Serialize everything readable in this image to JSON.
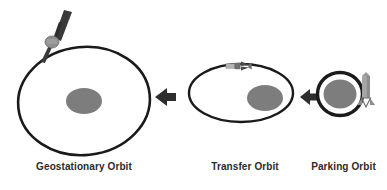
{
  "diagram": {
    "background_color": "#ffffff",
    "stroke_color": "#1a1a1a",
    "earth_color": "#7d7d7d",
    "satellite_body_color": "#8a8a8a",
    "satellite_panel_color": "#3a3a3a",
    "rocket_color": "#9a9a9a",
    "arrow_color": "#2e2e2e",
    "label_color": "#2b2b2b"
  },
  "labels": {
    "geostationary": "Geostationary Orbit",
    "transfer": "Transfer Orbit",
    "parking": "Parking Orbit"
  },
  "orbits": [
    {
      "id": "geostationary",
      "name": "Geostationary Orbit",
      "shape": "ellipse",
      "center": [
        84,
        101
      ],
      "radius": [
        66,
        54
      ],
      "rotation": -6,
      "stroke_width": 2.6,
      "earth": {
        "cx": 84,
        "cy": 101,
        "rx": 18,
        "ry": 13
      },
      "has_satellite": true
    },
    {
      "id": "transfer",
      "name": "Transfer Orbit",
      "shape": "ellipse",
      "center": [
        241,
        93
      ],
      "radius": [
        52,
        29
      ],
      "rotation": 0,
      "stroke_width": 2.4,
      "earth": {
        "cx": 265,
        "cy": 98,
        "rx": 18,
        "ry": 13
      },
      "has_satellite": true
    },
    {
      "id": "parking",
      "name": "Parking Orbit",
      "shape": "ellipse",
      "center": [
        340,
        94
      ],
      "radius": [
        23,
        22
      ],
      "rotation": 0,
      "stroke_width": 3.2,
      "earth": {
        "cx": 340,
        "cy": 94,
        "rx": 17,
        "ry": 15
      },
      "has_satellite": false
    }
  ],
  "arrows": [
    {
      "id": "arrow-transfer-to-geo",
      "direction": "left",
      "tip": [
        155,
        97
      ],
      "length": 20
    },
    {
      "id": "arrow-parking-to-transfer",
      "direction": "left",
      "tip": [
        300,
        97
      ],
      "length": 17
    }
  ],
  "satellites": [
    {
      "id": "geostationary-satellite",
      "position": [
        52,
        38
      ],
      "description": "satellite with solar panel on geostationary orbit"
    },
    {
      "id": "transfer-satellite",
      "position": [
        237,
        72
      ],
      "description": "small satellite on transfer orbit apogee"
    }
  ],
  "launch_vehicle": {
    "id": "launch-rocket",
    "position": [
      365,
      90
    ],
    "description": "launch vehicle at parking orbit injection point"
  }
}
